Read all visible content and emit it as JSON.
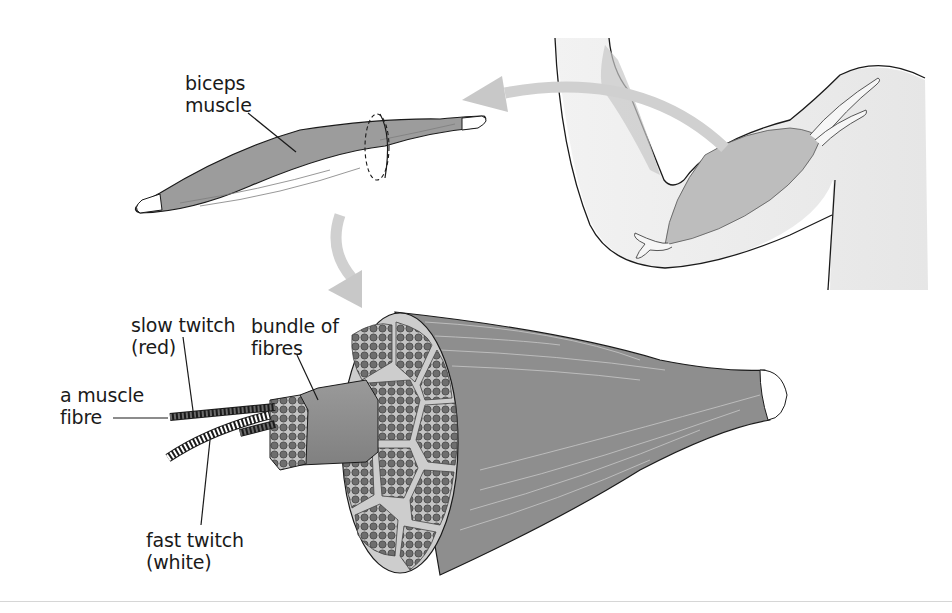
{
  "diagram": {
    "labels": {
      "biceps": {
        "line1": "biceps",
        "line2": "muscle"
      },
      "slow_twitch": {
        "line1": "slow twitch",
        "line2": "(red)"
      },
      "bundle": {
        "line1": "bundle of",
        "line2": "fibres"
      },
      "muscle_fibre": {
        "line1": "a muscle",
        "line2": "fibre"
      },
      "fast_twitch": {
        "line1": "fast twitch",
        "line2": "(white)"
      }
    },
    "parts": [
      "arm with biceps",
      "isolated biceps muscle",
      "muscle cross-section",
      "bundle of fibres",
      "slow twitch fibre",
      "fast twitch fibre"
    ],
    "colors": {
      "muscle": "#8a8a8a",
      "muscle_light": "#b4b4b4",
      "skin": "#eeeeee",
      "arrow": "#cfcfcf",
      "outline": "#1a1a1a",
      "tendon": "#ffffff",
      "fibre_dot": "#6e6e6e"
    }
  }
}
